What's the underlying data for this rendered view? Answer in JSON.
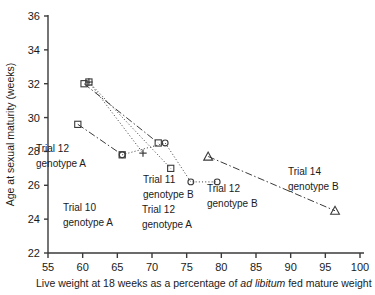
{
  "chart_data": {
    "type": "scatter",
    "title": "",
    "xlabel": "Live weight at 18 weeks as a percentage of ad libitum fed mature weight",
    "ylabel": "Age at sexual maturity (weeks)",
    "xlim": [
      55,
      100
    ],
    "ylim": [
      22,
      36
    ],
    "xticks": [
      55,
      60,
      65,
      70,
      75,
      80,
      85,
      90,
      95,
      100
    ],
    "yticks": [
      22,
      24,
      26,
      28,
      30,
      32,
      34,
      36
    ],
    "grid": false,
    "legend_position": "none",
    "xlabel_italic_part": "ad libitum",
    "series": [
      {
        "name": "Trial 10 genotype A",
        "marker": "square",
        "line": "dashdot",
        "points": [
          [
            60.2,
            32.0
          ],
          [
            70.9,
            28.5
          ]
        ]
      },
      {
        "name": "Trial 11 genotype B",
        "marker": "square",
        "line": "dotted",
        "points": [
          [
            60.9,
            32.1
          ],
          [
            72.7,
            27.0
          ]
        ]
      },
      {
        "name": "Trial 12 genotype A",
        "marker": "plus",
        "line": "dotted",
        "points": [
          [
            60.9,
            32.1
          ],
          [
            68.7,
            27.9
          ]
        ]
      },
      {
        "name": "Trial 12 genotype A (low)",
        "marker": "square",
        "line": "dashdot",
        "points": [
          [
            59.3,
            29.6
          ],
          [
            65.7,
            27.8
          ]
        ]
      },
      {
        "name": "Trial 12 genotype B",
        "marker": "circle",
        "line": "dotted",
        "points": [
          [
            65.7,
            27.8
          ],
          [
            71.9,
            28.5
          ],
          [
            75.6,
            26.2
          ],
          [
            79.4,
            26.2
          ]
        ]
      },
      {
        "name": "Trial 14 genotype B",
        "marker": "triangle",
        "line": "dashdot",
        "points": [
          [
            78.1,
            27.7
          ],
          [
            96.4,
            24.5
          ]
        ]
      }
    ],
    "annotations": [
      {
        "id": "trial-10-genotype-a",
        "line1": "Trial 10",
        "line2": "genotype A",
        "x": 63,
        "y": 211
      },
      {
        "id": "trial-12-genotype-a-right",
        "line1": "Trial 12",
        "line2": "genotype A",
        "x": 142,
        "y": 213
      },
      {
        "id": "trial-12-genotype-a-left",
        "line1": "Trial 12",
        "line2": "genotype A",
        "x": 36,
        "y": 152
      },
      {
        "id": "trial-11-genotype-b",
        "line1": "Trial 11",
        "line2": "genotype B",
        "x": 143,
        "y": 183
      },
      {
        "id": "trial-12-genotype-b",
        "line1": "Trial 12",
        "line2": "genotype B",
        "x": 207,
        "y": 192
      },
      {
        "id": "trial-14-genotype-b",
        "line1": "Trial 14",
        "line2": "genotype B",
        "x": 288,
        "y": 175
      }
    ]
  },
  "axis": {
    "y_title": "Age at sexual maturity (weeks)",
    "x_title_pre": "Live weight at 18 weeks as a percentage of ",
    "x_title_italic": "ad libitum",
    "x_title_post": " fed mature weight",
    "xticks": [
      "55",
      "60",
      "65",
      "70",
      "75",
      "80",
      "85",
      "90",
      "95",
      "100"
    ],
    "yticks": [
      "36",
      "34",
      "32",
      "30",
      "28",
      "26",
      "24",
      "22"
    ]
  },
  "colors": {
    "axis": "#3a3a3a",
    "marker": "#3a3a3a",
    "text": "#1a1a1a",
    "background": "#ffffff"
  }
}
